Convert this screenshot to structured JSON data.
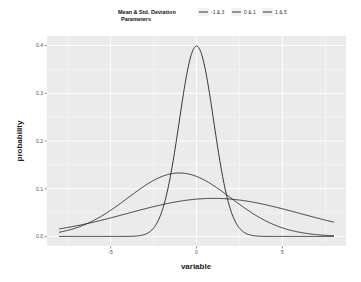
{
  "chart_data": {
    "type": "line",
    "title": "",
    "xlabel": "variable",
    "ylabel": "probability",
    "xlim": [
      -8.7,
      8.7
    ],
    "ylim": [
      -0.02,
      0.42
    ],
    "x_ticks": [
      -5,
      0,
      5
    ],
    "x_tick_labels": [
      "-5",
      "0",
      "5"
    ],
    "y_ticks": [
      0.0,
      0.1,
      0.2,
      0.3,
      0.4
    ],
    "y_tick_labels": [
      "0.0",
      "0.1",
      "0.2",
      "0.3",
      "0.4"
    ],
    "grid": true,
    "legend": {
      "title": "Mean & Std. Deviation Parameters",
      "title_lines": [
        "Mean & Std. Deviation",
        "Parameters"
      ],
      "placement": "top",
      "entries": [
        "-1 & 3",
        "0 & 1",
        "1 & 5"
      ]
    },
    "x_range": [
      -8,
      8
    ],
    "series": [
      {
        "name": "-1 & 3",
        "distribution": "normal",
        "mean": -1,
        "sd": 3,
        "color": "#222222"
      },
      {
        "name": "0 & 1",
        "distribution": "normal",
        "mean": 0,
        "sd": 1,
        "color": "#222222"
      },
      {
        "name": "1 & 5",
        "distribution": "normal",
        "mean": 1,
        "sd": 5,
        "color": "#222222"
      }
    ],
    "colors": {
      "panel": "#ebebeb",
      "grid": "#ffffff",
      "line": "#222222"
    }
  }
}
